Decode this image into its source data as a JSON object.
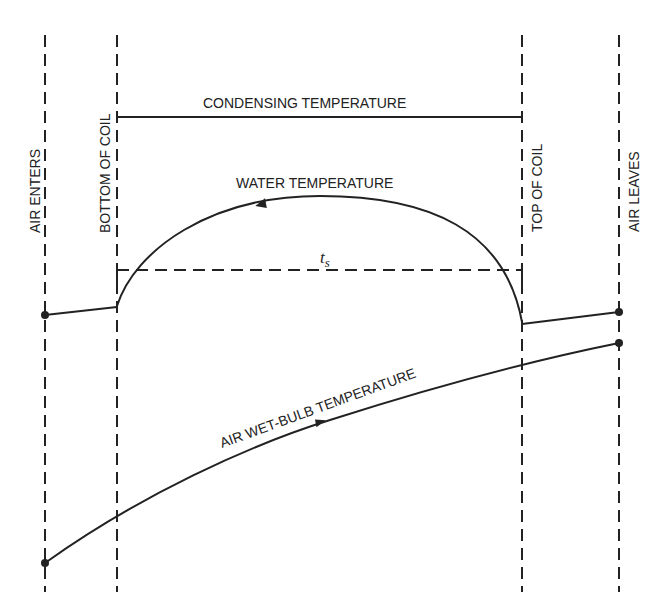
{
  "diagram": {
    "title": "",
    "vertical_lines": [
      {
        "id": "air-enters",
        "label": "AIR ENTERS",
        "x": 45
      },
      {
        "id": "bottom-of-coil",
        "label": "BOTTOM OF COIL",
        "x": 117
      },
      {
        "id": "top-of-coil",
        "label": "TOP OF COIL",
        "x": 522
      },
      {
        "id": "air-leaves",
        "label": "AIR LEAVES",
        "x": 619
      }
    ],
    "curves": {
      "condensing": {
        "label": "CONDENSING TEMPERATURE"
      },
      "water": {
        "label": "WATER TEMPERATURE",
        "direction": "top-of-coil to bottom-of-coil"
      },
      "saturation": {
        "label": "t",
        "subscript": "s"
      },
      "wet_bulb": {
        "label": "AIR WET-BULB TEMPERATURE",
        "direction": "air-enters to air-leaves"
      }
    },
    "colors": {
      "line": "#222222",
      "background": "#ffffff"
    }
  }
}
